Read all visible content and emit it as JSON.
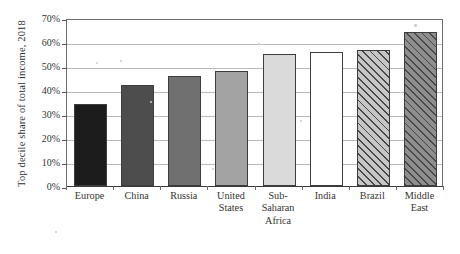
{
  "chart_data": {
    "type": "bar",
    "title": "",
    "xlabel": "",
    "ylabel": "Top decile share of total income, 2018",
    "ylim": [
      0,
      70
    ],
    "ytick_labels": [
      "0%",
      "10%",
      "20%",
      "30%",
      "40%",
      "50%",
      "60%",
      "70%"
    ],
    "ytick_values": [
      0,
      10,
      20,
      30,
      40,
      50,
      60,
      70
    ],
    "grid": true,
    "legend": "none",
    "categories": [
      "Europe",
      "China",
      "Russia",
      "United States",
      "Sub-Saharan Africa",
      "India",
      "Brazil",
      "Middle East"
    ],
    "category_lines": [
      [
        "Europe"
      ],
      [
        "China"
      ],
      [
        "Russia"
      ],
      [
        "United",
        "States"
      ],
      [
        "Sub-",
        "Saharan",
        "Africa"
      ],
      [
        "India"
      ],
      [
        "Brazil"
      ],
      [
        "Middle",
        "East"
      ]
    ],
    "values": [
      34,
      42,
      46,
      48,
      55,
      56,
      56.5,
      64
    ],
    "bar_styles": [
      {
        "fill": "#1c1c1c",
        "hatch": false
      },
      {
        "fill": "#4d4d4d",
        "hatch": false
      },
      {
        "fill": "#707070",
        "hatch": false
      },
      {
        "fill": "#a3a3a3",
        "hatch": false
      },
      {
        "fill": "#dadada",
        "hatch": false
      },
      {
        "fill": "#ffffff",
        "hatch": false
      },
      {
        "fill": "#c6c6c6",
        "hatch": true
      },
      {
        "fill": "#8e8e8e",
        "hatch": true
      }
    ]
  }
}
